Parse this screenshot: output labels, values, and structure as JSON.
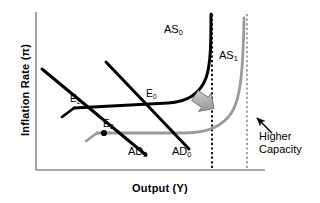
{
  "figure": {
    "type": "economics-diagram",
    "title": "",
    "background_color": "#ffffff"
  },
  "axes": {
    "y_label": "Inflation Rate (π)",
    "x_label": "Output (Y)",
    "axis_color": "#808080",
    "y_axis": {
      "x": 36,
      "y_top": 12,
      "y_bottom": 170
    },
    "x_axis": {
      "y": 170,
      "x_left": 36,
      "x_right": 265
    }
  },
  "series": {
    "as0": {
      "label": "AS",
      "sub": "0",
      "color": "#000000",
      "description": "Original aggregate supply curve: flat at low output, curving up to vertical at original capacity"
    },
    "as1": {
      "label": "AS",
      "sub": "1",
      "color": "#9a9a9a",
      "description": "Shifted aggregate supply curve: flat at lower inflation, vertical at higher capacity"
    },
    "ad0": {
      "label": "AD",
      "sub": "0",
      "color": "#000000",
      "description": "Original downward sloping aggregate demand curve"
    },
    "ad2": {
      "label": "AD",
      "sub": "2",
      "color": "#000000",
      "description": "Lower downward sloping aggregate demand curve"
    }
  },
  "points": [
    {
      "name": "E0",
      "label": "E",
      "sub": "0",
      "x": 155,
      "y": 103,
      "marker": false
    },
    {
      "name": "E2",
      "label": "E",
      "sub": "2",
      "x": 78,
      "y": 110,
      "marker": false
    },
    {
      "name": "E3",
      "label": "E",
      "sub": "3",
      "x": 104,
      "y": 133,
      "marker": true
    }
  ],
  "capacity_lines": [
    {
      "name": "original-capacity",
      "x": 212,
      "color": "#000000",
      "style": "dotted"
    },
    {
      "name": "higher-capacity",
      "x": 247,
      "color": "#9a9a9a",
      "style": "dotted"
    }
  ],
  "annotations": {
    "higher_capacity": {
      "line1": "Higher",
      "line2": "Capacity",
      "arrow": "up-left-arrow"
    },
    "shift_arrow": {
      "name": "block-arrow",
      "direction": "down-right",
      "color": "#a8a8a8"
    }
  },
  "labels": {
    "as0_pos": {
      "x": 165,
      "y": 30
    },
    "as1_pos": {
      "x": 220,
      "y": 56
    },
    "ad0_pos": {
      "x": 175,
      "y": 150
    },
    "ad2_pos": {
      "x": 131,
      "y": 150
    }
  }
}
